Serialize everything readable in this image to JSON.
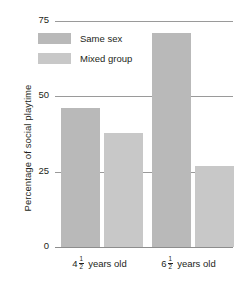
{
  "chart_data": {
    "type": "bar",
    "title": "",
    "xlabel": "",
    "ylabel": "Percentage of social playtime",
    "categories": [
      "4½ years old",
      "6½ years old"
    ],
    "category_parts": [
      {
        "whole": "4",
        "num": "1",
        "den": "2",
        "rest": "years old"
      },
      {
        "whole": "6",
        "num": "1",
        "den": "2",
        "rest": "years old"
      }
    ],
    "series": [
      {
        "name": "Same sex",
        "color": "#b9b9b9",
        "values": [
          46,
          71
        ]
      },
      {
        "name": "Mixed group",
        "color": "#c8c8c8",
        "values": [
          38,
          27
        ]
      }
    ],
    "ylim": [
      0,
      75
    ],
    "yticks": [
      0,
      25,
      50,
      75
    ],
    "ytick_labels": [
      "0",
      "25",
      "50",
      "75"
    ],
    "grid": true,
    "legend_position": "inside-top-left",
    "axis_color": "#9a9a9a",
    "text_color": "#231f20",
    "background": "#ffffff"
  }
}
